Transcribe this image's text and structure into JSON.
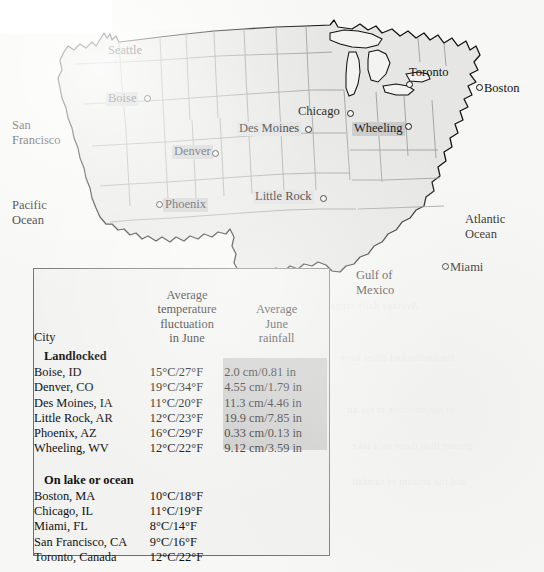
{
  "map": {
    "region_labels": [
      {
        "name": "san-francisco",
        "text": "San\nFrancisco",
        "x": 12,
        "y": 118,
        "style": "plain"
      },
      {
        "name": "pacific-ocean",
        "text": "Pacific\nOcean",
        "x": 12,
        "y": 198,
        "style": "plain"
      },
      {
        "name": "atlantic-ocean",
        "text": "Atlantic\nOcean",
        "x": 465,
        "y": 212,
        "style": "plain"
      },
      {
        "name": "gulf-of-mexico",
        "text": "Gulf of\nMexico",
        "x": 356,
        "y": 268,
        "style": "plain"
      }
    ],
    "cities": [
      {
        "name": "seattle",
        "label": "Seattle",
        "lx": 108,
        "ly": 44,
        "dx": 101,
        "dy": 41,
        "highlight": "none",
        "dot": false
      },
      {
        "name": "boise",
        "label": "Boise",
        "lx": 106,
        "ly": 92,
        "dx": 144,
        "dy": 95,
        "highlight": "dark",
        "dot": true
      },
      {
        "name": "denver",
        "label": "Denver",
        "lx": 172,
        "ly": 145,
        "dx": 212,
        "dy": 150,
        "highlight": "dark",
        "dot": true
      },
      {
        "name": "phoenix",
        "label": "Phoenix",
        "lx": 163,
        "ly": 198,
        "dx": 156,
        "dy": 201,
        "highlight": "dark",
        "dot": true
      },
      {
        "name": "des-moines",
        "label": "Des Moines",
        "lx": 237,
        "ly": 122,
        "dx": 305,
        "dy": 126,
        "highlight": "light",
        "dot": true
      },
      {
        "name": "little-rock",
        "label": "Little Rock",
        "lx": 253,
        "ly": 190,
        "dx": 320,
        "dy": 195,
        "highlight": "light",
        "dot": true
      },
      {
        "name": "chicago",
        "label": "Chicago",
        "lx": 298,
        "ly": 105,
        "dx": 347,
        "dy": 110,
        "highlight": "none",
        "dot": true
      },
      {
        "name": "wheeling",
        "label": "Wheeling",
        "lx": 352,
        "ly": 122,
        "dx": 405,
        "dy": 123,
        "highlight": "dark",
        "dot": true
      },
      {
        "name": "toronto",
        "label": "Toronto",
        "lx": 409,
        "ly": 66,
        "dx": 406,
        "dy": 81,
        "highlight": "none",
        "dot": true
      },
      {
        "name": "boston",
        "label": "Boston",
        "lx": 484,
        "ly": 82,
        "dx": 476,
        "dy": 84,
        "highlight": "none",
        "dot": true
      },
      {
        "name": "miami",
        "label": "Miami",
        "lx": 450,
        "ly": 261,
        "dx": 442,
        "dy": 263,
        "highlight": "none",
        "dot": true
      }
    ]
  },
  "table": {
    "headers": {
      "city": "City",
      "temperature": "Average\ntemperature\nfluctuation\nin June",
      "rainfall": "Average\nJune\nrainfall"
    },
    "groups": [
      {
        "name": "landlocked",
        "label": "Landlocked",
        "rows": [
          {
            "city": "Boise, ID",
            "temperature": "15°C/27°F",
            "rainfall": "2.0 cm/0.81 in"
          },
          {
            "city": "Denver, CO",
            "temperature": "19°C/34°F",
            "rainfall": "4.55 cm/1.79 in"
          },
          {
            "city": "Des Moines, IA",
            "temperature": "11°C/20°F",
            "rainfall": "11.3 cm/4.46 in"
          },
          {
            "city": "Little Rock, AR",
            "temperature": "12°C/23°F",
            "rainfall": "19.9 cm/7.85 in"
          },
          {
            "city": "Phoenix, AZ",
            "temperature": "16°C/29°F",
            "rainfall": "0.33 cm/0.13 in"
          },
          {
            "city": "Wheeling, WV",
            "temperature": "12°C/22°F",
            "rainfall": "9.12 cm/3.59 in"
          }
        ]
      },
      {
        "name": "on-lake-or-ocean",
        "label": "On lake or ocean",
        "rows": [
          {
            "city": "Boston, MA",
            "temperature": "10°C/18°F",
            "rainfall": ""
          },
          {
            "city": "Chicago, IL",
            "temperature": "11°C/19°F",
            "rainfall": ""
          },
          {
            "city": "Miami, FL",
            "temperature": "8°C/14°F",
            "rainfall": ""
          },
          {
            "city": "San Francisco, CA",
            "temperature": "9°C/16°F",
            "rainfall": ""
          },
          {
            "city": "Toronto, Canada",
            "temperature": "12°C/22°F",
            "rainfall": ""
          }
        ]
      }
    ]
  },
  "colors": {
    "page_background": "#f7f7f5",
    "map_land": "#e6e6e4",
    "map_outline": "#111111",
    "state_border": "#9a9a9a",
    "table_background": "#f2f2f0",
    "table_border": "#6e6e6e",
    "highlight_dark": "#c9c9c9",
    "highlight_light": "#dedede",
    "shaded_column": "#c8c8c8"
  }
}
